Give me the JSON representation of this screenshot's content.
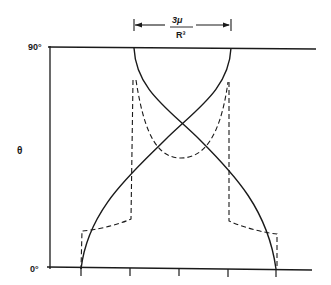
{
  "diagram": {
    "y_axis_label": "θ",
    "y_top_tick": "90°",
    "y_bottom_tick": "0°",
    "dimension_label_numerator": "3μ",
    "dimension_label_denominator": "R³",
    "colors": {
      "ink": "#1a1a1a",
      "background": "#ffffff"
    },
    "curves": [
      {
        "name": "solid-curve-left",
        "style": "solid"
      },
      {
        "name": "solid-curve-right",
        "style": "solid"
      },
      {
        "name": "dashed-curve-left",
        "style": "dashed"
      },
      {
        "name": "dashed-curve-right",
        "style": "dashed"
      }
    ]
  }
}
